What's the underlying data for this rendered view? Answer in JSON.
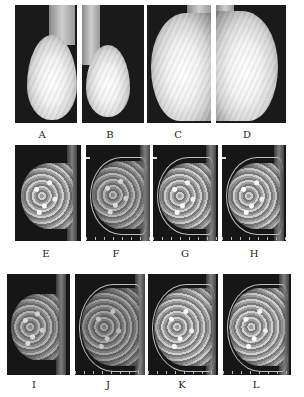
{
  "figure": {
    "rows": [
      {
        "modality": "mammogram",
        "panels": [
          {
            "label": "A",
            "view": "oblique"
          },
          {
            "label": "B",
            "view": "oblique"
          },
          {
            "label": "C",
            "view": "craniocaudal"
          },
          {
            "label": "D",
            "view": "craniocaudal"
          }
        ]
      },
      {
        "modality": "MRI",
        "panels": [
          {
            "label": "E"
          },
          {
            "label": "F"
          },
          {
            "label": "G"
          },
          {
            "label": "H"
          }
        ]
      },
      {
        "modality": "MRI",
        "panels": [
          {
            "label": "I"
          },
          {
            "label": "J"
          },
          {
            "label": "K"
          },
          {
            "label": "L"
          }
        ]
      }
    ]
  }
}
